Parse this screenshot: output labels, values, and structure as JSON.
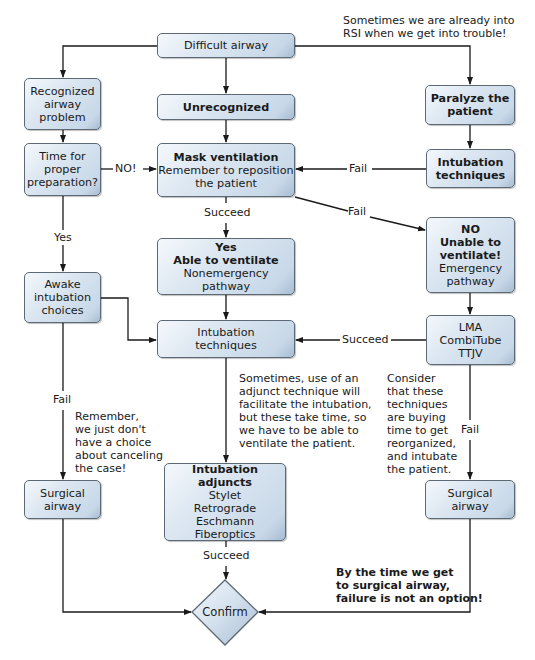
{
  "diagram": {
    "type": "flowchart",
    "nodes": {
      "difficult_airway": {
        "lines": [
          "Difficult airway"
        ]
      },
      "recognized": {
        "lines": [
          "Recognized",
          "airway",
          "problem"
        ]
      },
      "unrecognized": {
        "lines": [
          "Unrecognized"
        ]
      },
      "paralyze": {
        "lines": [
          "Paralyze the",
          "patient"
        ]
      },
      "time_prep": {
        "lines": [
          "Time for",
          "proper",
          "preparation?"
        ]
      },
      "mask_vent": {
        "bold": "Mask ventilation",
        "lines": [
          "Remember to reposition",
          "the patient"
        ]
      },
      "intubation_right": {
        "lines": [
          "Intubation",
          "techniques"
        ]
      },
      "able_vent": {
        "bold1": "Yes",
        "bold2": "Able to ventilate",
        "lines": [
          "Nonemergency",
          "pathway"
        ]
      },
      "unable_vent": {
        "bold1": "NO",
        "bold2": "Unable to",
        "bold3": "ventilate!",
        "lines": [
          "Emergency",
          "pathway"
        ]
      },
      "awake": {
        "lines": [
          "Awake",
          "intubation",
          "choices"
        ]
      },
      "intubation_center": {
        "lines": [
          "Intubation",
          "techniques"
        ]
      },
      "lma": {
        "lines": [
          "LMA",
          "CombiTube",
          "TTJV"
        ]
      },
      "adjuncts": {
        "bold": "Intubation adjuncts",
        "lines": [
          "Stylet",
          "Retrograde",
          "Eschmann",
          "Fiberoptics"
        ]
      },
      "surgical_left": {
        "lines": [
          "Surgical",
          "airway"
        ]
      },
      "surgical_right": {
        "lines": [
          "Surgical",
          "airway"
        ]
      },
      "confirm": {
        "lines": [
          "Confirm"
        ]
      }
    },
    "edge_labels": {
      "no": "NO!",
      "yes": "Yes",
      "fail_int_to_mask": "Fail",
      "fail_mask_to_unable": "Fail",
      "succeed_mask": "Succeed",
      "succeed_lma": "Succeed",
      "fail_awake": "Fail",
      "fail_lma": "Fail",
      "succeed_adjuncts": "Succeed"
    },
    "notes": {
      "rsi": [
        "Sometimes we are already into",
        "RSI when we get into trouble!"
      ],
      "adjunct": [
        "Sometimes, use of an",
        "adjunct technique will",
        "facilitate the intubation,",
        "but these take time, so",
        "we have to be able to",
        "ventilate the patient."
      ],
      "remember": [
        "Remember,",
        "we just don't",
        "have a choice",
        "about canceling",
        "the case!"
      ],
      "consider": [
        "Consider",
        "that these",
        "techniques",
        "are buying",
        "time to get",
        "reorganized,",
        "and intubate",
        "the patient."
      ],
      "failure": [
        "By the time we get",
        "to surgical airway,",
        "failure is not an option!"
      ]
    },
    "colors": {
      "box_fill_light": "#f4f8fc",
      "box_fill_mid": "#c8d8e8",
      "box_border": "#5d6a76",
      "line": "#1a1a1a"
    }
  }
}
